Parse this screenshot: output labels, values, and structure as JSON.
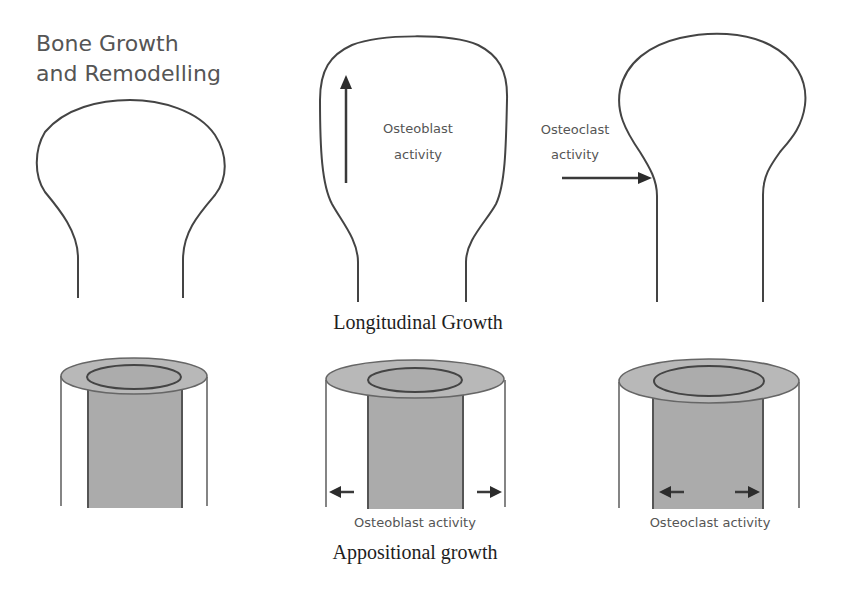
{
  "title": {
    "line1": "Bone Growth",
    "line2": "and Remodelling"
  },
  "longitudinal": {
    "caption": "Longitudinal Growth",
    "panel2": {
      "label_line1": "Osteoblast",
      "label_line2": "activity"
    },
    "panel3": {
      "label_line1": "Osteoclast",
      "label_line2": "activity"
    }
  },
  "appositional": {
    "caption": "Appositional growth",
    "panel2": {
      "label": "Osteoblast activity"
    },
    "panel3": {
      "label": "Osteoclast activity"
    }
  },
  "colors": {
    "outline": "#444444",
    "cortex_fill": "#b4b4b4",
    "marrow_fill": "#a9a9a9",
    "text_label": "#555555",
    "text_caption": "#1e1e1e"
  }
}
